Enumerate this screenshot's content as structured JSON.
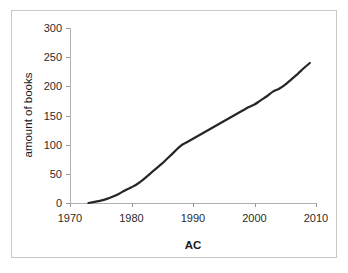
{
  "figure": {
    "background_color": "#ffffff",
    "frame_color": "#c8c8c8",
    "axis_color": "#b0b0b0",
    "line_color": "#262626"
  },
  "chart_data": {
    "type": "line",
    "title": "",
    "xlabel": "AC",
    "ylabel": "amount of books",
    "xlim": [
      1970,
      2010
    ],
    "ylim": [
      0,
      300
    ],
    "xticks": [
      1970,
      1980,
      1990,
      2000,
      2010
    ],
    "xtick_labels": [
      "1970",
      "1980",
      "1990",
      "2000",
      "2010"
    ],
    "yticks": [
      0,
      50,
      100,
      150,
      200,
      250,
      300
    ],
    "ytick_labels": [
      "0",
      "50",
      "100",
      "150",
      "200",
      "250",
      "300"
    ],
    "grid": false,
    "legend": false,
    "series": [
      {
        "name": "amount of books",
        "x": [
          1973,
          1974,
          1975,
          1976,
          1977,
          1978,
          1979,
          1980,
          1981,
          1982,
          1983,
          1984,
          1985,
          1986,
          1987,
          1988,
          1989,
          1990,
          1991,
          1992,
          1993,
          1994,
          1995,
          1996,
          1997,
          1998,
          1999,
          2000,
          2001,
          2002,
          2003,
          2004,
          2005,
          2006,
          2007,
          2008,
          2009
        ],
        "values": [
          0,
          2,
          4,
          7,
          11,
          16,
          22,
          27,
          33,
          41,
          50,
          59,
          68,
          78,
          88,
          98,
          104,
          110,
          116,
          122,
          128,
          134,
          140,
          146,
          152,
          158,
          164,
          169,
          176,
          183,
          191,
          196,
          203,
          212,
          221,
          231,
          240
        ]
      }
    ]
  }
}
